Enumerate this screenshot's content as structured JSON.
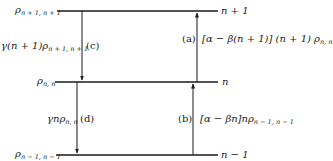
{
  "levels": [
    {
      "id": "n_plus_1",
      "state_label": "n + 1",
      "rho_label": "ρ",
      "rho_sub": "n + 1, n + 1"
    },
    {
      "id": "n",
      "state_label": "n",
      "rho_label": "ρ",
      "rho_sub": "n, n"
    },
    {
      "id": "n_minus_1",
      "state_label": "n − 1",
      "rho_label": "ρ",
      "rho_sub": "n − 1, n − 1"
    }
  ],
  "transitions": {
    "a": {
      "tag": "(a)",
      "expr": "[α − β(n + 1)] (n + 1) ρ",
      "sub": "n, n",
      "direction": "up",
      "from": "n",
      "to": "n_plus_1"
    },
    "b": {
      "tag": "(b)",
      "expr": "[α − βn]nρ",
      "sub": "n − 1, n − 1",
      "direction": "up",
      "from": "n_minus_1",
      "to": "n"
    },
    "c": {
      "tag": "(c)",
      "expr": "γ(n + 1)ρ",
      "sub": "n + 1, n + 1",
      "direction": "down",
      "from": "n_plus_1",
      "to": "n"
    },
    "d": {
      "tag": "(d)",
      "expr": "γnρ",
      "sub": "n, n",
      "direction": "down",
      "from": "n",
      "to": "n_minus_1"
    }
  },
  "colors": {
    "line": "#1a1a1a",
    "background": "#ffffff"
  }
}
